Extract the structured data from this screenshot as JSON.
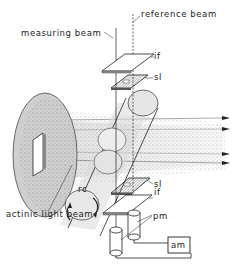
{
  "diagram": {
    "type": "apparatus-schematic",
    "labels": {
      "reference_beam": "reference beam",
      "measuring_beam": "measuring beam",
      "interference_filter_top": "if",
      "slit_top": "sl",
      "slit_bottom": "sl",
      "reaction_cell": "rc",
      "interference_filter_bottom": "if",
      "actinic_light_beam": "actinic light beam",
      "photomultipliers": "pm",
      "amplifier": "am"
    },
    "colors": {
      "ink": "#222222",
      "shading": "#9a9a9a",
      "background": "#ffffff"
    },
    "components": [
      {
        "id": "lamp-disc",
        "desc": "large circular lamp housing with square window"
      },
      {
        "id": "actinic-beam",
        "desc": "stippled light beam with 4 arrows to the right"
      },
      {
        "id": "reaction-cell",
        "desc": "diagonal cylindrical cell with rotation arrows"
      },
      {
        "id": "filter-top",
        "desc": "interference filter plate (if)"
      },
      {
        "id": "slit-top",
        "desc": "shaded slit plate (sl)"
      },
      {
        "id": "slit-bottom",
        "desc": "shaded slit plate (sl)"
      },
      {
        "id": "filter-bottom",
        "desc": "interference filter plate (if)"
      },
      {
        "id": "pm-left",
        "desc": "photomultiplier tube"
      },
      {
        "id": "pm-right",
        "desc": "photomultiplier tube"
      },
      {
        "id": "amplifier-box",
        "desc": "amplifier box (am)"
      }
    ]
  }
}
